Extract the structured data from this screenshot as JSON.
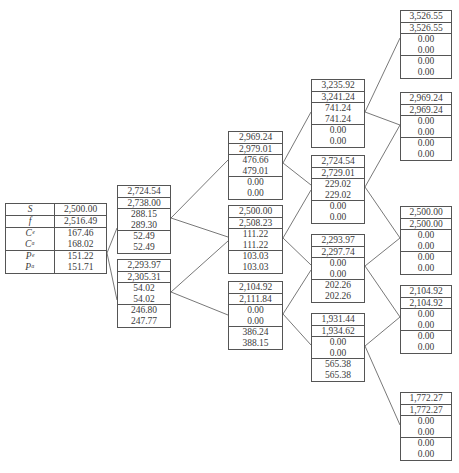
{
  "diagram": {
    "type": "binomial-tree",
    "root": {
      "rows": [
        {
          "label": "S",
          "value": "2,500.00"
        },
        {
          "label": "f",
          "value": "2,516.49"
        },
        {
          "label": "Cᵉ",
          "value": "167.46"
        },
        {
          "label": "Cᵃ",
          "value": "168.02"
        },
        {
          "label": "Pᵉ",
          "value": "151.22"
        },
        {
          "label": "Pᵃ",
          "value": "151.71"
        }
      ]
    },
    "levels": [
      {
        "step": 1,
        "nodes": [
          {
            "id": "u",
            "values": [
              "2,724.54",
              "2,738.00",
              "288.15",
              "289.30",
              "52.49",
              "52.49"
            ]
          },
          {
            "id": "d",
            "values": [
              "2,293.97",
              "2,305.31",
              "54.02",
              "54.02",
              "246.80",
              "247.77"
            ]
          }
        ]
      },
      {
        "step": 2,
        "nodes": [
          {
            "id": "uu",
            "values": [
              "2,969.24",
              "2,979.01",
              "476.66",
              "479.01",
              "0.00",
              "0.00"
            ]
          },
          {
            "id": "ud",
            "values": [
              "2,500.00",
              "2,508.23",
              "111.22",
              "111.22",
              "103.03",
              "103.03"
            ]
          },
          {
            "id": "dd",
            "values": [
              "2,104.92",
              "2,111.84",
              "0.00",
              "0.00",
              "386.24",
              "388.15"
            ]
          }
        ]
      },
      {
        "step": 3,
        "nodes": [
          {
            "id": "uuu",
            "values": [
              "3,235.92",
              "3,241.24",
              "741.24",
              "741.24",
              "0.00",
              "0.00"
            ]
          },
          {
            "id": "uud",
            "values": [
              "2,724.54",
              "2,729.01",
              "229.02",
              "229.02",
              "0.00",
              "0.00"
            ]
          },
          {
            "id": "udd",
            "values": [
              "2,293.97",
              "2,297.74",
              "0.00",
              "0.00",
              "202.26",
              "202.26"
            ]
          },
          {
            "id": "ddd",
            "values": [
              "1,931.44",
              "1,934.62",
              "0.00",
              "0.00",
              "565.38",
              "565.38"
            ]
          }
        ]
      },
      {
        "step": 4,
        "nodes": [
          {
            "id": "uuuu",
            "values": [
              "3,526.55",
              "3,526.55",
              "0.00",
              "0.00",
              "0.00",
              "0.00"
            ]
          },
          {
            "id": "uuud",
            "values": [
              "2,969.24",
              "2,969.24",
              "0.00",
              "0.00",
              "0.00",
              "0.00"
            ]
          },
          {
            "id": "uudd",
            "values": [
              "2,500.00",
              "2,500.00",
              "0.00",
              "0.00",
              "0.00",
              "0.00"
            ]
          },
          {
            "id": "uddd",
            "values": [
              "2,104.92",
              "2,104.92",
              "0.00",
              "0.00",
              "0.00",
              "0.00"
            ]
          },
          {
            "id": "dddd",
            "values": [
              "1,772.27",
              "1,772.27",
              "0.00",
              "0.00",
              "0.00",
              "0.00"
            ]
          }
        ]
      }
    ]
  }
}
